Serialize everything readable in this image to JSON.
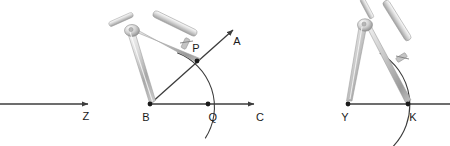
{
  "figure": {
    "background_color": "#ffffff",
    "stroke_color": "#3c3c3c",
    "label_color": "#1a1a1a",
    "metal_light": "#f2f2f2",
    "metal_mid": "#c9c9c9",
    "metal_dark": "#8d8d8d"
  },
  "panels": [
    {
      "id": "panel-left",
      "name": "target-ray",
      "labels": [
        {
          "text": "Z",
          "x": 86,
          "y": 120
        }
      ],
      "rays": [
        {
          "name": "ray-to-Z",
          "x1": 0,
          "y1": 104,
          "x2": 88,
          "y2": 104,
          "arrow": true
        }
      ]
    },
    {
      "id": "panel-middle",
      "name": "original-angle-with-compass",
      "labels": [
        {
          "text": "P",
          "x": 196,
          "y": 52
        },
        {
          "text": "A",
          "x": 236,
          "y": 44
        },
        {
          "text": "B",
          "x": 146,
          "y": 121
        },
        {
          "text": "Q",
          "x": 212,
          "y": 121
        },
        {
          "text": "C",
          "x": 259,
          "y": 121
        }
      ],
      "vertex": {
        "name": "point-B",
        "x": 150,
        "y": 104
      },
      "points": [
        {
          "name": "point-P",
          "x": 197,
          "y": 61
        },
        {
          "name": "point-Q",
          "x": 208,
          "y": 104
        }
      ],
      "rays": [
        {
          "name": "ray-BA",
          "x1": 150,
          "y1": 104,
          "x2": 233,
          "y2": 30,
          "arrow": true
        },
        {
          "name": "ray-BC",
          "x1": 150,
          "y1": 104,
          "x2": 254,
          "y2": 104,
          "arrow": true
        }
      ],
      "arc": {
        "name": "arc-PQ",
        "cx": 150,
        "cy": 104,
        "r": 58,
        "from_deg": -62,
        "to_deg": 18
      }
    },
    {
      "id": "panel-right",
      "name": "copied-ray-with-compass",
      "labels": [
        {
          "text": "Y",
          "x": 344,
          "y": 121
        },
        {
          "text": "K",
          "x": 412,
          "y": 121
        }
      ],
      "vertex": {
        "name": "point-Y",
        "x": 348,
        "y": 104
      },
      "points": [
        {
          "name": "point-K",
          "x": 408,
          "y": 104
        }
      ],
      "rays": [
        {
          "name": "ray-YK",
          "x1": 348,
          "y1": 104,
          "x2": 450,
          "y2": 104,
          "arrow": false
        }
      ],
      "arc": {
        "name": "arc-K",
        "cx": 348,
        "cy": 104,
        "r": 60,
        "from_deg": -58,
        "to_deg": 42
      }
    }
  ],
  "compasses": [
    {
      "name": "compass-middle",
      "pivot_x": 131,
      "pivot_y": 31,
      "needle_tip_x": 150,
      "needle_tip_y": 104,
      "pencil_tip_x": 197,
      "pencil_tip_y": 61
    },
    {
      "name": "compass-right",
      "pivot_x": 364,
      "pivot_y": 26,
      "needle_tip_x": 348,
      "needle_tip_y": 104,
      "pencil_tip_x": 408,
      "pencil_tip_y": 104
    }
  ]
}
